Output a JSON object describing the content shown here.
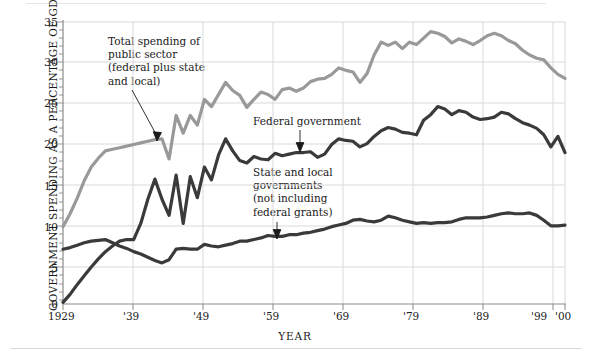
{
  "chart_data": {
    "type": "line",
    "title": "",
    "xlabel": "YEAR",
    "ylabel": "GOVERNMENT SPENDING AS A PERCENTAGE OF GDP",
    "xlim": [
      1929,
      2000
    ],
    "ylim": [
      0,
      35
    ],
    "grid": true,
    "legend_position": "inline-annotations",
    "x_tick_labels": [
      "1929",
      "'39",
      "'49",
      "'59",
      "'69",
      "'79",
      "'89",
      "'99",
      "'00"
    ],
    "x_tick_values": [
      1929,
      1939,
      1949,
      1959,
      1969,
      1979,
      1989,
      1999,
      2000
    ],
    "y_tick_labels": [
      "0",
      "5",
      "10",
      "15",
      "20",
      "25",
      "30",
      "35"
    ],
    "y_tick_values": [
      0,
      5,
      10,
      15,
      20,
      25,
      30,
      35
    ],
    "x": [
      1929,
      1930,
      1931,
      1932,
      1933,
      1934,
      1935,
      1936,
      1937,
      1938,
      1939,
      1940,
      1941,
      1942,
      1943,
      1944,
      1945,
      1946,
      1947,
      1948,
      1949,
      1950,
      1951,
      1952,
      1953,
      1954,
      1955,
      1956,
      1957,
      1958,
      1959,
      1960,
      1961,
      1962,
      1963,
      1964,
      1965,
      1966,
      1967,
      1968,
      1969,
      1970,
      1971,
      1972,
      1973,
      1974,
      1975,
      1976,
      1977,
      1978,
      1979,
      1980,
      1981,
      1982,
      1983,
      1984,
      1985,
      1986,
      1987,
      1988,
      1989,
      1990,
      1991,
      1992,
      1993,
      1994,
      1995,
      1996,
      1997,
      1998,
      1999,
      2000
    ],
    "series": [
      {
        "name": "Total spending of public sector (federal plus state and local)",
        "color": "#999999",
        "values": [
          9.6,
          11.2,
          13.1,
          15.3,
          17.0,
          18.1,
          19.0,
          19.2,
          19.4,
          19.6,
          19.8,
          20.0,
          20.2,
          20.4,
          20.5,
          18.0,
          23.4,
          21.2,
          23.4,
          22.2,
          25.4,
          24.5,
          26.0,
          27.5,
          26.5,
          25.9,
          24.4,
          25.4,
          26.3,
          26.0,
          25.4,
          26.6,
          26.8,
          26.4,
          26.8,
          27.6,
          27.9,
          28.0,
          28.5,
          29.3,
          29.0,
          28.8,
          27.5,
          28.6,
          30.9,
          32.5,
          32.1,
          32.5,
          31.7,
          32.5,
          32.2,
          33.0,
          33.8,
          33.6,
          33.2,
          32.4,
          32.9,
          32.6,
          32.2,
          32.7,
          33.3,
          33.6,
          33.3,
          32.7,
          32.3,
          31.5,
          30.9,
          30.5,
          30.3,
          29.3,
          28.5,
          28.0
        ]
      },
      {
        "name": "Federal government",
        "color": "#3a3a3a",
        "values": [
          0.2,
          1.2,
          2.4,
          3.5,
          4.6,
          5.6,
          6.5,
          7.2,
          7.8,
          8.0,
          8.0,
          10.0,
          13.0,
          15.5,
          13.0,
          11.0,
          16.0,
          10.0,
          15.8,
          13.2,
          17.0,
          15.4,
          18.5,
          20.5,
          19.0,
          17.8,
          17.5,
          18.3,
          18.0,
          17.9,
          18.7,
          18.4,
          18.6,
          18.8,
          18.8,
          18.9,
          18.2,
          18.6,
          19.8,
          20.5,
          20.3,
          20.2,
          19.5,
          19.9,
          20.8,
          21.5,
          21.9,
          21.7,
          21.3,
          21.2,
          21.0,
          22.8,
          23.5,
          24.5,
          24.2,
          23.5,
          24.0,
          23.8,
          23.2,
          22.9,
          23.0,
          23.2,
          23.8,
          23.6,
          23.0,
          22.5,
          22.2,
          21.8,
          21.0,
          19.5,
          20.8,
          18.8
        ]
      },
      {
        "name": "State and local governments (not including federal grants)",
        "color": "#3a3a3a",
        "values": [
          6.8,
          7.0,
          7.3,
          7.6,
          7.8,
          7.9,
          8.0,
          7.6,
          7.2,
          6.9,
          6.5,
          6.2,
          5.8,
          5.4,
          5.1,
          5.5,
          6.8,
          6.9,
          6.8,
          6.8,
          7.4,
          7.2,
          7.1,
          7.3,
          7.5,
          7.8,
          7.8,
          8.0,
          8.2,
          8.5,
          8.4,
          8.4,
          8.6,
          8.6,
          8.8,
          8.9,
          9.1,
          9.3,
          9.6,
          9.8,
          10.0,
          10.4,
          10.5,
          10.3,
          10.2,
          10.4,
          10.9,
          10.7,
          10.4,
          10.2,
          10.0,
          10.1,
          10.0,
          10.1,
          10.1,
          10.2,
          10.5,
          10.7,
          10.7,
          10.7,
          10.8,
          11.0,
          11.2,
          11.3,
          11.2,
          11.2,
          11.3,
          11.0,
          10.4,
          9.7,
          9.7,
          9.8
        ]
      }
    ],
    "annotations": [
      {
        "id": "total-annotation",
        "text": "Total spending of\npublic sector\n(federal plus state\nand local)",
        "target_series": "Total spending of public sector (federal plus state and local)"
      },
      {
        "id": "federal-annotation",
        "text": "Federal government",
        "target_series": "Federal government"
      },
      {
        "id": "state-local-annotation",
        "text": "State and local\ngovernments\n(not including\nfederal grants)",
        "target_series": "State and local governments (not including federal grants)"
      }
    ],
    "colors": {
      "total_line": "#999999",
      "federal_line": "#3a3a3a",
      "state_local_line": "#3a3a3a",
      "grid": "#d9d9d9",
      "axis": "#8a8a8a",
      "text": "#1a1a1a",
      "background": "#ffffff"
    }
  }
}
